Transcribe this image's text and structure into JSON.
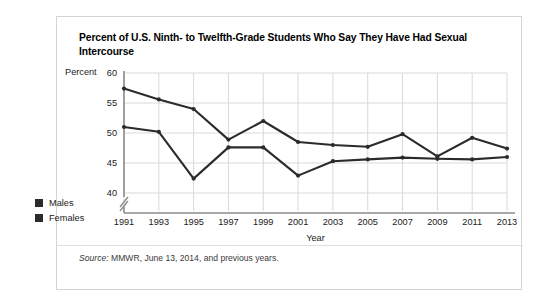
{
  "title": "Percent of U.S. Ninth- to Twelfth-Grade Students Who Say They Have Had Sexual Intercourse",
  "percent_axis_label": "Percent",
  "legend": {
    "items": [
      {
        "label": "Males",
        "color": "#2b2b2b"
      },
      {
        "label": "Females",
        "color": "#2b2b2b"
      }
    ]
  },
  "source": {
    "prefix": "Source:",
    "text": " MMWR, June 13, 2014, and previous years."
  },
  "chart_data": {
    "type": "line",
    "title": "Percent of U.S. Ninth- to Twelfth-Grade Students Who Say They Have Had Sexual Intercourse",
    "xlabel": "Year",
    "ylabel": "Percent",
    "categories": [
      1991,
      1993,
      1995,
      1997,
      1999,
      2001,
      2003,
      2005,
      2007,
      2009,
      2011,
      2013
    ],
    "xtick_labels": [
      "1991",
      "1993",
      "1995",
      "1997",
      "1999",
      "2001",
      "2003",
      "2005",
      "2007",
      "2009",
      "2011",
      "2013"
    ],
    "ytick_labels": [
      "40",
      "45",
      "50",
      "55",
      "60"
    ],
    "yticks": [
      40,
      45,
      50,
      55,
      60
    ],
    "ylim": [
      40,
      60
    ],
    "xlim": [
      1991,
      2013
    ],
    "axis_break": true,
    "grid": true,
    "legend_position": "left-outside",
    "series": [
      {
        "name": "Males",
        "color": "#2b2b2b",
        "values": [
          57.4,
          55.6,
          54.0,
          48.9,
          52.0,
          48.5,
          48.0,
          47.7,
          49.8,
          46.1,
          49.2,
          47.4
        ]
      },
      {
        "name": "Females",
        "color": "#2b2b2b",
        "values": [
          51.0,
          50.2,
          42.4,
          47.6,
          47.6,
          42.9,
          45.3,
          45.6,
          45.9,
          45.7,
          45.6,
          46.0
        ]
      }
    ]
  }
}
